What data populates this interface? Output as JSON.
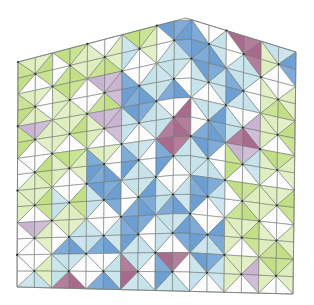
{
  "figure": {
    "palette": {
      "W": "#fbfcfb",
      "G": "#c3df86",
      "g": "#dfeebf",
      "B": "#6d9fd3",
      "b": "#c6e3eb",
      "M": "#a96b8d",
      "m": "#cab4d2"
    },
    "outline": {
      "top_left": [
        18,
        62
      ],
      "peak": [
        186,
        18
      ],
      "top_right": [
        296,
        52
      ],
      "bottom_right": [
        293,
        294
      ],
      "bottom_left": [
        17,
        287
      ]
    },
    "cols": 8,
    "rows": 7,
    "cells": [
      [
        "gGWG",
        "GgGW",
        "WgGg",
        "GgWb",
        "BBbW",
        "WbBB",
        "MMbW",
        "bBWg"
      ],
      [
        "gWgG",
        "GWgg",
        "mmGW",
        "WbBB",
        "bWBb",
        "BbWb",
        "bWbB",
        "WgGg"
      ],
      [
        "mgWG",
        "gGWg",
        "mmWg",
        "BbWb",
        "WMMb",
        "bBBW",
        "WmMb",
        "gGWg"
      ],
      [
        "WGgW",
        "GgWg",
        "gWBB",
        "bWbB",
        "MbWB",
        "BWbb",
        "mbWG",
        "GgWg"
      ],
      [
        "gGWg",
        "WGgb",
        "BBWb",
        "bBBW",
        "WbBb",
        "BbWB",
        "GgGW",
        "gGWg"
      ],
      [
        "mgWW",
        "gbBW",
        "WbBb",
        "BWbB",
        "bBWb",
        "WBbB",
        "gGWg",
        "WgGg"
      ],
      [
        "WgbW",
        "bWMb",
        "WbBW",
        "bWbM",
        "MWbB",
        "BbWb",
        "gmWg",
        "GgWg"
      ]
    ]
  }
}
